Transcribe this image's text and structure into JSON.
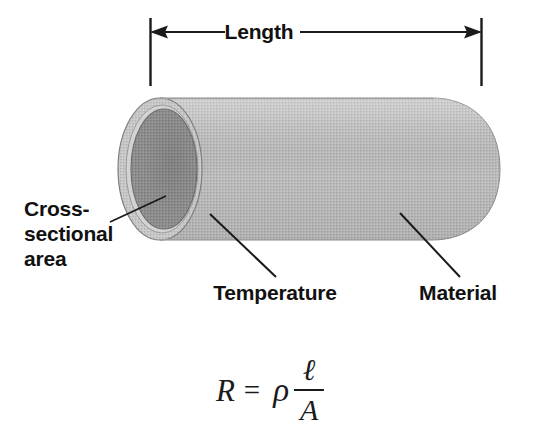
{
  "figure": {
    "title_label": "Length",
    "labels": {
      "length": "Length",
      "cross_sectional_line1": "Cross-",
      "cross_sectional_line2": "sectional",
      "cross_sectional_line3": "area",
      "temperature": "Temperature",
      "material": "Material"
    },
    "equation": {
      "variable": "R",
      "equals": "=",
      "rho": "ρ",
      "numerator": "ℓ",
      "denominator": "A",
      "plain_text": "R = ρ ℓ/A"
    },
    "colors": {
      "background": "#ffffff",
      "cylinder_body": "#b4b4b4",
      "cylinder_body_light": "#c8c8c8",
      "cylinder_rim": "#c2c2c2",
      "cross_section_fill": "#8e8e8e",
      "outline": "#6f6f6f",
      "leader_line": "#1a1a1a",
      "text": "#111111"
    },
    "geometry": {
      "dimension_line_y": 32,
      "dimension_tick_left_x": 150,
      "dimension_tick_right_x": 481,
      "dimension_tick_top_y": 18,
      "dimension_tick_bottom_y": 86,
      "cylinder_top_y": 98,
      "cylinder_bottom_y": 240,
      "cylinder_left_x": 118,
      "cylinder_right_x": 500
    }
  }
}
